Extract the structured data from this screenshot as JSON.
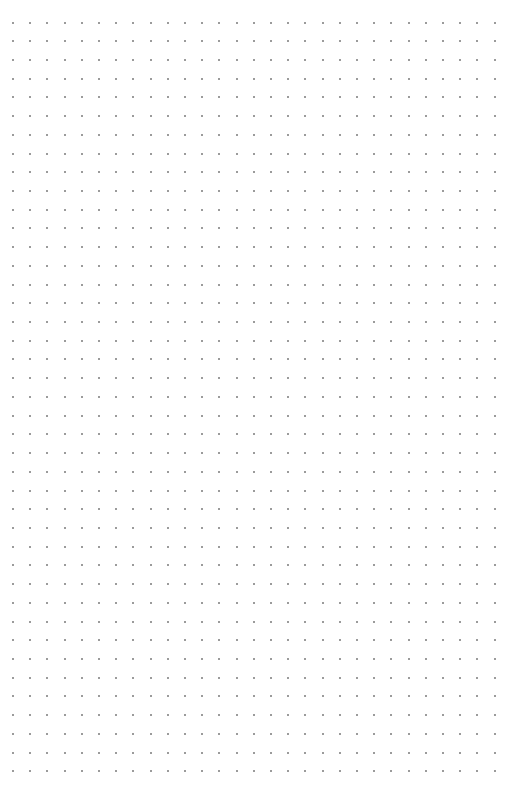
{
  "page": {
    "type": "dot-grid-paper",
    "background_color": "#ffffff",
    "dot_color": "#7a7a7a"
  },
  "grid": {
    "columns": 29,
    "rows": 41,
    "origin_x": 13,
    "origin_y": 22.5,
    "spacing_x": 17.2,
    "spacing_y": 18.72,
    "dot_size": 2
  }
}
